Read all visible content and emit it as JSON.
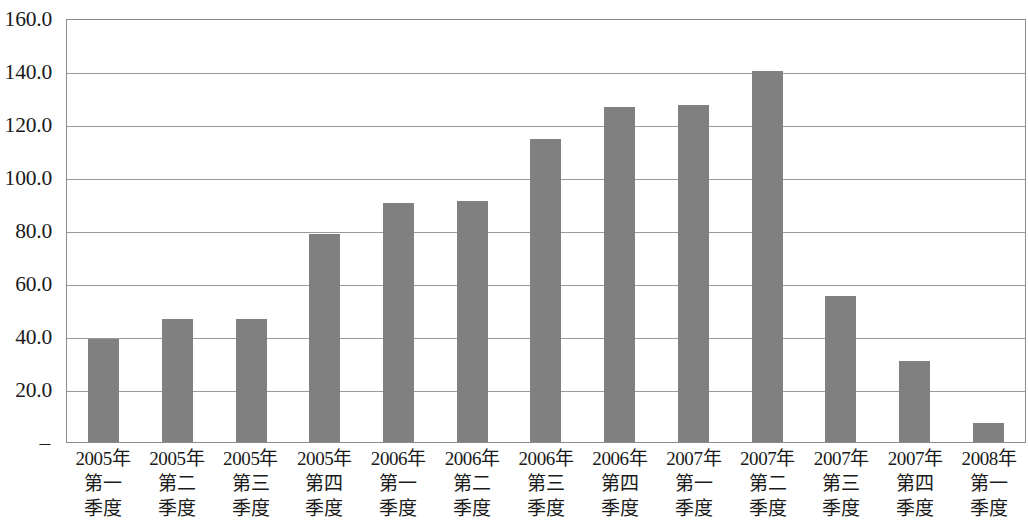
{
  "chart_data": {
    "type": "bar",
    "title": "",
    "subtitle": "",
    "xlabel": "",
    "ylabel": "",
    "categories": [
      "2005年第一季度",
      "2005年第二季度",
      "2005年第三季度",
      "2005年第四季度",
      "2006年第一季度",
      "2006年第二季度",
      "2006年第三季度",
      "2006年第四季度",
      "2007年第一季度",
      "2007年第二季度",
      "2007年第三季度",
      "2007年第四季度",
      "2008年第一季度"
    ],
    "category_lines": [
      [
        "2005年",
        "第一",
        "季度"
      ],
      [
        "2005年",
        "第二",
        "季度"
      ],
      [
        "2005年",
        "第三",
        "季度"
      ],
      [
        "2005年",
        "第四",
        "季度"
      ],
      [
        "2006年",
        "第一",
        "季度"
      ],
      [
        "2006年",
        "第二",
        "季度"
      ],
      [
        "2006年",
        "第三",
        "季度"
      ],
      [
        "2006年",
        "第四",
        "季度"
      ],
      [
        "2007年",
        "第一",
        "季度"
      ],
      [
        "2007年",
        "第二",
        "季度"
      ],
      [
        "2007年",
        "第三",
        "季度"
      ],
      [
        "2007年",
        "第四",
        "季度"
      ],
      [
        "2008年",
        "第一",
        "季度"
      ]
    ],
    "values": [
      39.0,
      46.5,
      46.5,
      78.5,
      90.3,
      91.0,
      114.5,
      126.3,
      127.0,
      140.0,
      55.0,
      30.5,
      7.0
    ],
    "ylim": [
      0,
      160
    ],
    "ytick_values": [
      0,
      20,
      40,
      60,
      80,
      100,
      120,
      140,
      160
    ],
    "ytick_labels": [
      "–",
      "20.0",
      "40.0",
      "60.0",
      "80.0",
      "100.0",
      "120.0",
      "140.0",
      "160.0"
    ],
    "grid": true,
    "legend": false,
    "legend_position": "none",
    "bar_color": "#808080",
    "gridline_color": "#9a9a9a",
    "axis_border_color": "#8c8c8c",
    "background_color": "#ffffff"
  }
}
